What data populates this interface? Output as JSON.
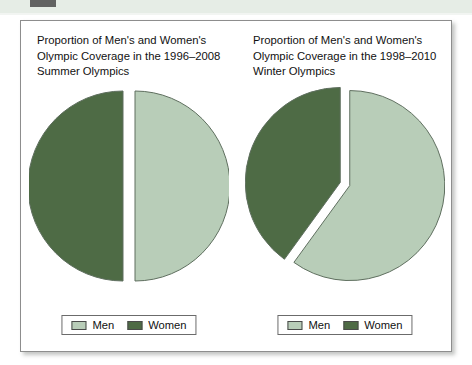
{
  "figure": {
    "panel_border_color": "#8d8d8d",
    "band_color": "#e6ede6"
  },
  "colors": {
    "men": "#b8cdb8",
    "women": "#4e6b45",
    "slice_outline": "#5f6f5f",
    "text": "#111111"
  },
  "legend": {
    "men_label": "Men",
    "women_label": "Women"
  },
  "charts": [
    {
      "title_line1": "Proportion of Men's and Women's",
      "title_line2": "Olympic Coverage in the 1996–2008",
      "title_line3": "Summer Olympics"
    },
    {
      "title_line1": "Proportion of Men's and Women's",
      "title_line2": "Olympic Coverage in the 1998–2010",
      "title_line3": "Winter Olympics"
    }
  ],
  "chart_data": [
    {
      "type": "pie",
      "title": "Proportion of Men's and Women's Olympic Coverage in the 1996–2008 Summer Olympics",
      "labels": [
        "Men",
        "Women"
      ],
      "values": [
        50,
        50
      ],
      "unit": "percent",
      "colors": [
        "#b8cdb8",
        "#4e6b45"
      ],
      "exploded": true,
      "legend_position": "bottom",
      "grid": false
    },
    {
      "type": "pie",
      "title": "Proportion of Men's and Women's Olympic Coverage in the 1998–2010 Winter Olympics",
      "labels": [
        "Men",
        "Women"
      ],
      "values": [
        60,
        40
      ],
      "unit": "percent",
      "colors": [
        "#b8cdb8",
        "#4e6b45"
      ],
      "exploded": true,
      "legend_position": "bottom",
      "grid": false
    }
  ]
}
